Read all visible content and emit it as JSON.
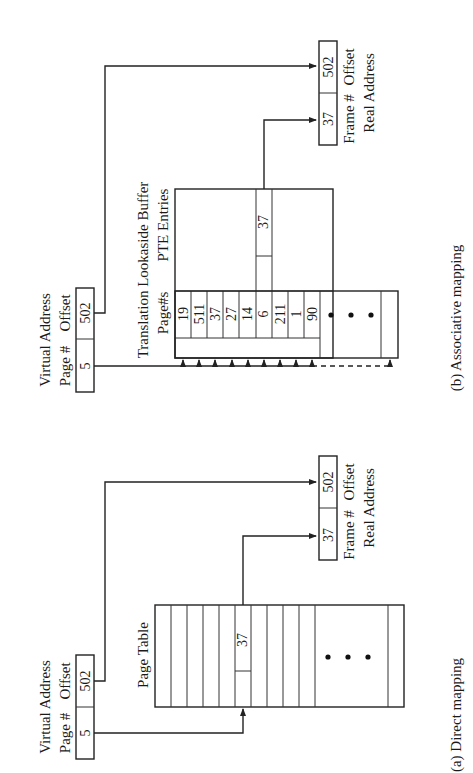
{
  "diagram": {
    "orientation": "rotated-90-ccw",
    "direct_mapping": {
      "caption": "(a) Direct mapping",
      "virtual_address": {
        "title": "Virtual Address",
        "page_label": "Page #",
        "offset_label": "Offset",
        "page_value": "5",
        "offset_value": "502"
      },
      "page_table": {
        "title": "Page Table",
        "highlight_entry": "37",
        "ellipsis": "• • •"
      },
      "real_address": {
        "title": "Real Address",
        "frame_label": "Frame #",
        "offset_label": "Offset",
        "frame_value": "37",
        "offset_value": "502"
      }
    },
    "associative_mapping": {
      "caption": "(b) Associative mapping",
      "virtual_address": {
        "title": "Virtual Address",
        "page_label": "Page #",
        "offset_label": "Offset",
        "page_value": "5",
        "offset_value": "502"
      },
      "tlb": {
        "title": "Translation Lookaside Buffer",
        "page_col_label": "Page#s",
        "pte_col_label": "PTE Entries",
        "page_numbers": [
          "19",
          "511",
          "37",
          "27",
          "14",
          "6",
          "211",
          "1",
          "90"
        ],
        "matched_pte": "37",
        "ellipsis": "• • •"
      },
      "real_address": {
        "title": "Real Address",
        "frame_label": "Frame #",
        "offset_label": "Offset",
        "frame_value": "37",
        "offset_value": "502"
      }
    }
  }
}
